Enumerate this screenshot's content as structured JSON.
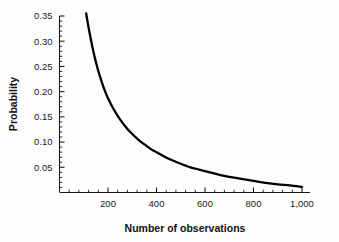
{
  "chart_data": {
    "type": "line",
    "title": "",
    "subtitle": "",
    "xlabel": "Number of observations",
    "ylabel": "Probability",
    "xlim": [
      0,
      1040
    ],
    "ylim": [
      0,
      0.365
    ],
    "grid": false,
    "legend": null,
    "x_ticks": [
      200,
      400,
      600,
      800,
      1000
    ],
    "x_tick_labels": [
      "200",
      "400",
      "600",
      "800",
      "1,000"
    ],
    "x_minor_step": 40,
    "y_ticks": [
      0.05,
      0.1,
      0.15,
      0.2,
      0.25,
      0.3,
      0.35
    ],
    "y_tick_labels": [
      "0.05",
      "0.10",
      "0.15",
      "0.20",
      "0.25",
      "0.30",
      "0.35"
    ],
    "y_minor_step": 0.01,
    "line_color": "#000000",
    "line_width": 2.3,
    "series": [
      {
        "name": "Probability",
        "x": [
          110,
          120,
          130,
          140,
          150,
          160,
          175,
          190,
          200,
          220,
          240,
          260,
          280,
          300,
          320,
          340,
          360,
          380,
          400,
          430,
          460,
          500,
          540,
          580,
          620,
          660,
          700,
          750,
          800,
          850,
          900,
          950,
          1000
        ],
        "y": [
          0.355,
          0.327,
          0.302,
          0.279,
          0.259,
          0.241,
          0.218,
          0.198,
          0.187,
          0.168,
          0.152,
          0.138,
          0.126,
          0.116,
          0.107,
          0.099,
          0.092,
          0.085,
          0.08,
          0.072,
          0.065,
          0.057,
          0.05,
          0.045,
          0.04,
          0.035,
          0.031,
          0.027,
          0.023,
          0.019,
          0.016,
          0.014,
          0.011
        ]
      }
    ]
  },
  "axes": {
    "x_title": "Number of observations",
    "y_title": "Probability"
  }
}
